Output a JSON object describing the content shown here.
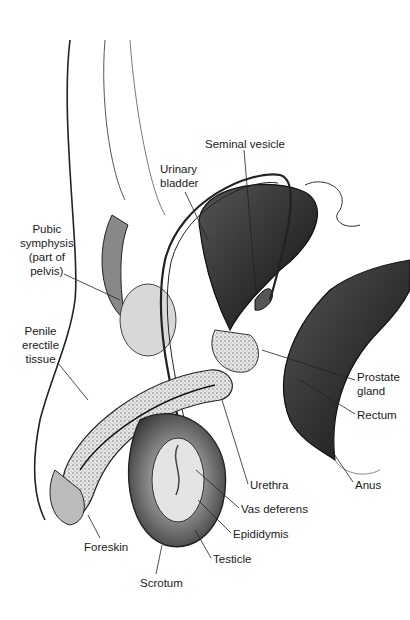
{
  "diagram": {
    "type": "anatomical-illustration",
    "labels": [
      {
        "id": "seminal-vesicle",
        "text": "Seminal vesicle",
        "x": 205,
        "y": 137
      },
      {
        "id": "urinary-bladder",
        "text": "Urinary\nbladder",
        "x": 160,
        "y": 162
      },
      {
        "id": "pubic-symphysis",
        "text": "Pubic\nsymphysis\n(part of\npelvis)",
        "x": 24,
        "y": 222
      },
      {
        "id": "penile-erectile-tissue",
        "text": "Penile\nerectile\ntissue",
        "x": 26,
        "y": 324
      },
      {
        "id": "prostate-gland",
        "text": "Prostate\ngland",
        "x": 357,
        "y": 370
      },
      {
        "id": "rectum",
        "text": "Rectum",
        "x": 357,
        "y": 408
      },
      {
        "id": "anus",
        "text": "Anus",
        "x": 355,
        "y": 478
      },
      {
        "id": "urethra",
        "text": "Urethra",
        "x": 250,
        "y": 478
      },
      {
        "id": "vas-deferens",
        "text": "Vas deferens",
        "x": 241,
        "y": 502
      },
      {
        "id": "epididymis",
        "text": "Epididymis",
        "x": 233,
        "y": 527
      },
      {
        "id": "testicle",
        "text": "Testicle",
        "x": 213,
        "y": 552
      },
      {
        "id": "foreskin",
        "text": "Foreskin",
        "x": 84,
        "y": 540
      },
      {
        "id": "scrotum",
        "text": "Scrotum",
        "x": 140,
        "y": 576
      }
    ]
  }
}
